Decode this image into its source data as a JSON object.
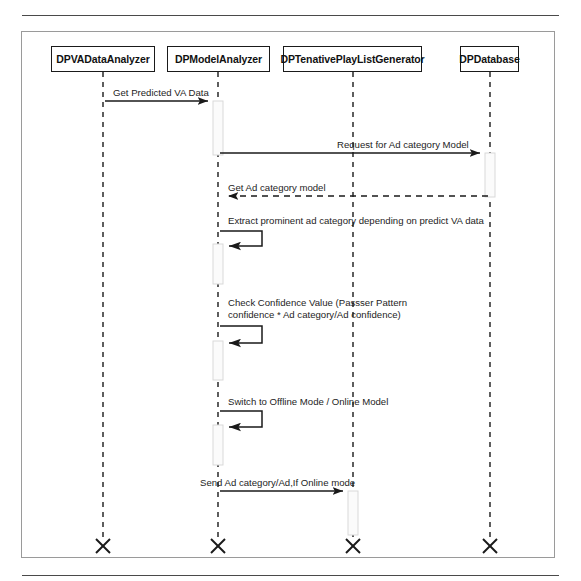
{
  "diagram": {
    "type": "uml-sequence-diagram",
    "title": "",
    "colors": {
      "line": "#1a1a1a",
      "frame": "#9a9a9a",
      "rule": "#4a4a4a",
      "activation_fill": "#fbfbfb",
      "activation_stroke": "#d9d9d9",
      "background": "#ffffff"
    },
    "lifelines": [
      {
        "id": "va",
        "label": "DPVADataAnalyzer",
        "x": 103,
        "box_left": 51,
        "box_width": 104
      },
      {
        "id": "ma",
        "label": "DPModelAnalyzer",
        "x": 218,
        "box_left": 167,
        "box_width": 103
      },
      {
        "id": "tpl",
        "label": "DPTenativePlayListGenerator",
        "x": 353,
        "box_left": 283,
        "box_width": 139
      },
      {
        "id": "db",
        "label": "DPDatabase",
        "x": 490,
        "box_left": 460,
        "box_width": 59
      }
    ],
    "messages": [
      {
        "id": "m1",
        "label": "Get Predicted VA Data",
        "from": "va",
        "to": "ma",
        "kind": "call",
        "style": "solid",
        "y": 101,
        "label_x": 113,
        "label_y": 87
      },
      {
        "id": "m2",
        "label": "Request for Ad category Model",
        "from": "ma",
        "to": "db",
        "kind": "call",
        "style": "solid",
        "y": 153,
        "label_x": 337,
        "label_y": 139
      },
      {
        "id": "m3",
        "label": "Get Ad category model",
        "from": "db",
        "to": "ma",
        "kind": "return",
        "style": "dashed",
        "y": 196,
        "label_x": 228,
        "label_y": 182
      },
      {
        "id": "m4",
        "label": "Extract prominent ad category depending on predict VA data",
        "from": "ma",
        "to": "ma",
        "kind": "self",
        "style": "solid",
        "y": 231,
        "y_end": 246,
        "label_x": 228,
        "label_y": 215
      },
      {
        "id": "m5",
        "label": "Check Confidence Value (Passser Pattern confidence * Ad category/Ad confidence)",
        "from": "ma",
        "to": "ma",
        "kind": "self",
        "style": "solid",
        "y": 326,
        "y_end": 343,
        "label_x": 228,
        "label_y": 297
      },
      {
        "id": "m6",
        "label": "Switch to Offline Mode / Online Model",
        "from": "ma",
        "to": "ma",
        "kind": "self",
        "style": "solid",
        "y": 411,
        "y_end": 427,
        "label_x": 228,
        "label_y": 396
      },
      {
        "id": "m7",
        "label": "Send Ad category/Ad,If Online mode",
        "from": "ma",
        "to": "tpl",
        "kind": "call",
        "style": "solid",
        "y": 491,
        "label_x": 200,
        "label_y": 477
      }
    ],
    "activations": [
      {
        "id": "a1",
        "lifeline": "ma",
        "top": 101,
        "bottom": 155
      },
      {
        "id": "a2",
        "lifeline": "db",
        "top": 153,
        "bottom": 197
      },
      {
        "id": "a3",
        "lifeline": "ma",
        "top": 244,
        "bottom": 284
      },
      {
        "id": "a4",
        "lifeline": "ma",
        "top": 341,
        "bottom": 380
      },
      {
        "id": "a5",
        "lifeline": "ma",
        "top": 425,
        "bottom": 465
      },
      {
        "id": "a6",
        "lifeline": "tpl",
        "top": 491,
        "bottom": 535
      }
    ],
    "terminators": [
      {
        "lifeline": "va",
        "y": 546
      },
      {
        "lifeline": "ma",
        "y": 546
      },
      {
        "lifeline": "tpl",
        "y": 546
      },
      {
        "lifeline": "db",
        "y": 546
      }
    ],
    "lifeline_line": {
      "top": 72,
      "bottom": 541
    }
  }
}
